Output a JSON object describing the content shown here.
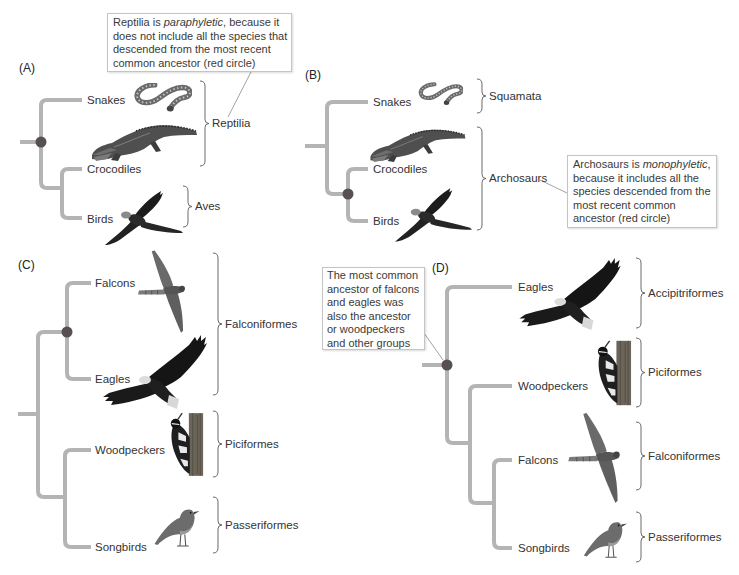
{
  "colors": {
    "background": "#ffffff",
    "branch": "#b4b4b4",
    "ancestor_node": "#575050",
    "text": "#333333",
    "bracket": "#6a6a6a",
    "callout_border": "#c4c4c4",
    "callout_pointer": "#8c8c8c"
  },
  "panels": {
    "a": {
      "label": "(A)",
      "topology": "(Snakes,(Crocodiles,Birds))",
      "taxa": [
        {
          "name": "Snakes",
          "image": "snake-photo"
        },
        {
          "name": "Crocodiles",
          "image": "crocodile-photo"
        },
        {
          "name": "Birds",
          "image": "bird-in-flight-photo"
        }
      ],
      "groups": [
        {
          "name": "Reptilia",
          "members": [
            "Snakes",
            "Crocodiles"
          ]
        },
        {
          "name": "Aves",
          "members": [
            "Birds"
          ]
        }
      ],
      "callout": {
        "before": "Reptilia is ",
        "emphasis": "paraphyletic",
        "after": ", because it\ndoes not include all the species that\ndescended from the most recent\ncommon ancestor (red circle)"
      }
    },
    "b": {
      "label": "(B)",
      "topology": "(Snakes,(Crocodiles,Birds))",
      "taxa": [
        {
          "name": "Snakes",
          "image": "snake-photo"
        },
        {
          "name": "Crocodiles",
          "image": "crocodile-photo"
        },
        {
          "name": "Birds",
          "image": "bird-in-flight-photo"
        }
      ],
      "groups": [
        {
          "name": "Squamata",
          "members": [
            "Snakes"
          ]
        },
        {
          "name": "Archosaurs",
          "members": [
            "Crocodiles",
            "Birds"
          ]
        }
      ],
      "callout": {
        "before": "Archosaurs is ",
        "emphasis": "monophyletic",
        "after": ",\nbecause it includes all the\nspecies descended from the\nmost recent common\nancestor (red circle)"
      }
    },
    "c": {
      "label": "(C)",
      "topology": "((Falcons,Eagles),(Woodpeckers,Songbirds))",
      "taxa": [
        {
          "name": "Falcons",
          "image": "falcon-photo"
        },
        {
          "name": "Eagles",
          "image": "eagle-photo"
        },
        {
          "name": "Woodpeckers",
          "image": "woodpecker-photo"
        },
        {
          "name": "Songbirds",
          "image": "songbird-photo"
        }
      ],
      "groups": [
        {
          "name": "Falconiformes",
          "members": [
            "Falcons",
            "Eagles"
          ]
        },
        {
          "name": "Piciformes",
          "members": [
            "Woodpeckers"
          ]
        },
        {
          "name": "Passeriformes",
          "members": [
            "Songbirds"
          ]
        }
      ]
    },
    "d": {
      "label": "(D)",
      "topology": "(Eagles,(Woodpeckers,(Falcons,Songbirds)))",
      "taxa": [
        {
          "name": "Eagles",
          "image": "eagle-photo"
        },
        {
          "name": "Woodpeckers",
          "image": "woodpecker-photo"
        },
        {
          "name": "Falcons",
          "image": "falcon-photo"
        },
        {
          "name": "Songbirds",
          "image": "songbird-photo"
        }
      ],
      "groups": [
        {
          "name": "Accipitriformes",
          "members": [
            "Eagles"
          ]
        },
        {
          "name": "Piciformes",
          "members": [
            "Woodpeckers"
          ]
        },
        {
          "name": "Falconiformes",
          "members": [
            "Falcons"
          ]
        },
        {
          "name": "Passeriformes",
          "members": [
            "Songbirds"
          ]
        }
      ],
      "callout": {
        "text": "The most common\nancestor of falcons\nand eagles was\nalso the ancestor\nor woodpeckers\nand other groups"
      }
    }
  }
}
